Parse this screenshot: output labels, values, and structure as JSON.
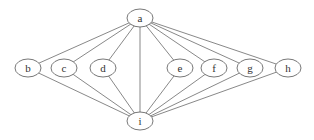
{
  "diagram": {
    "type": "graph",
    "nodes": [
      {
        "id": "a",
        "label": "a",
        "x": 140,
        "y": 18
      },
      {
        "id": "b",
        "label": "b",
        "x": 28,
        "y": 68
      },
      {
        "id": "c",
        "label": "c",
        "x": 64,
        "y": 68
      },
      {
        "id": "d",
        "label": "d",
        "x": 103,
        "y": 68
      },
      {
        "id": "e",
        "label": "e",
        "x": 180,
        "y": 68
      },
      {
        "id": "f",
        "label": "f",
        "x": 214,
        "y": 68
      },
      {
        "id": "g",
        "label": "g",
        "x": 250,
        "y": 68
      },
      {
        "id": "h",
        "label": "h",
        "x": 288,
        "y": 68
      },
      {
        "id": "i",
        "label": "i",
        "x": 140,
        "y": 121
      }
    ],
    "edges": [
      [
        "a",
        "b"
      ],
      [
        "a",
        "c"
      ],
      [
        "a",
        "d"
      ],
      [
        "a",
        "i"
      ],
      [
        "a",
        "e"
      ],
      [
        "a",
        "f"
      ],
      [
        "a",
        "g"
      ],
      [
        "a",
        "h"
      ],
      [
        "b",
        "i"
      ],
      [
        "c",
        "i"
      ],
      [
        "d",
        "i"
      ],
      [
        "e",
        "i"
      ],
      [
        "f",
        "i"
      ],
      [
        "g",
        "i"
      ],
      [
        "h",
        "i"
      ]
    ],
    "colors": {
      "stroke": "#555555",
      "text": "#333333",
      "background": "#ffffff"
    }
  }
}
